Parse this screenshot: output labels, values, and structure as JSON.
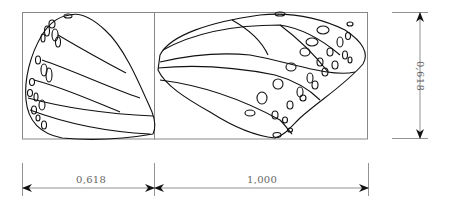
{
  "diagram": {
    "dimensions": {
      "bottom_left": "0,618",
      "bottom_right": "1,000",
      "right_vertical": "0,618"
    },
    "colors": {
      "outline": "#000000",
      "frame": "#888888",
      "dimension_line": "#777777"
    }
  }
}
